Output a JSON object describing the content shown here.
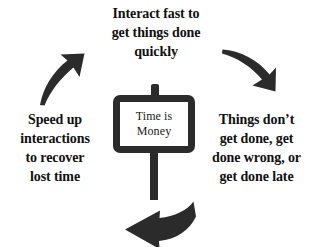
{
  "diagram": {
    "title_sign": {
      "text": "Time is\nMoney",
      "icon": "signpost-icon"
    },
    "background_color": "#ffffff",
    "ink_color": "#2b2b2b",
    "text_color": "#101010",
    "labels": {
      "top": "Interact fast to\nget things done\nquickly",
      "right": "Things don’t\nget done, get\ndone wrong, or\nget done late",
      "left": "Speed up\ninteractions\nto recover\nlost time"
    },
    "arrows": [
      {
        "name": "arrow-top-right",
        "direction": "down-right"
      },
      {
        "name": "arrow-bottom-leftward",
        "direction": "left"
      },
      {
        "name": "arrow-top-left",
        "direction": "up-right"
      }
    ]
  }
}
